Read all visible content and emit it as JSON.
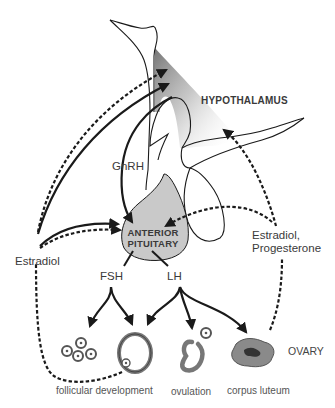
{
  "diagram": {
    "colors": {
      "stroke": "#1a1a1a",
      "pituitary_fill": "#c9c9c9",
      "hypothalamus_shade": "#8c8c8c",
      "ovary_tissue": "#8a8a8a",
      "corpus_core": "#3a3a3a",
      "text": "#3a3a3a"
    },
    "labels": {
      "hypothalamus": "HYPOTHALAMUS",
      "gnrh": "GnRH",
      "anterior_pituitary_line1": "ANTERIOR",
      "anterior_pituitary_line2": "PITUITARY",
      "fsh": "FSH",
      "lh": "LH",
      "estradiol": "Estradiol",
      "estradiol_progesterone_line1": "Estradiol,",
      "estradiol_progesterone_line2": "Progesterone",
      "ovary": "OVARY",
      "follicular_development": "follicular development",
      "ovulation": "ovulation",
      "corpus_luteum": "corpus luteum"
    },
    "legend": {
      "solid_arrow": "stimulation",
      "dashed_arrow": "feedback"
    }
  }
}
